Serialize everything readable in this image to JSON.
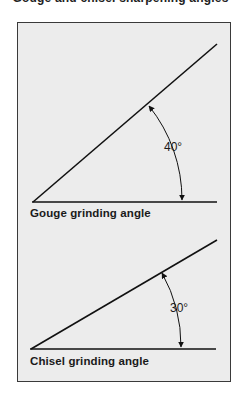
{
  "header": {
    "clipped_caption": "Gouge and chisel sharpening angles"
  },
  "diagrams": [
    {
      "id": "gouge",
      "caption": "Gouge grinding angle",
      "angle_label": "40°",
      "angle_degrees": 40
    },
    {
      "id": "chisel",
      "caption": "Chisel grinding angle",
      "angle_label": "30°",
      "angle_degrees": 30
    }
  ],
  "colors": {
    "panel_fill": "#ececec",
    "border": "#3a3a3a",
    "line": "#111111"
  }
}
